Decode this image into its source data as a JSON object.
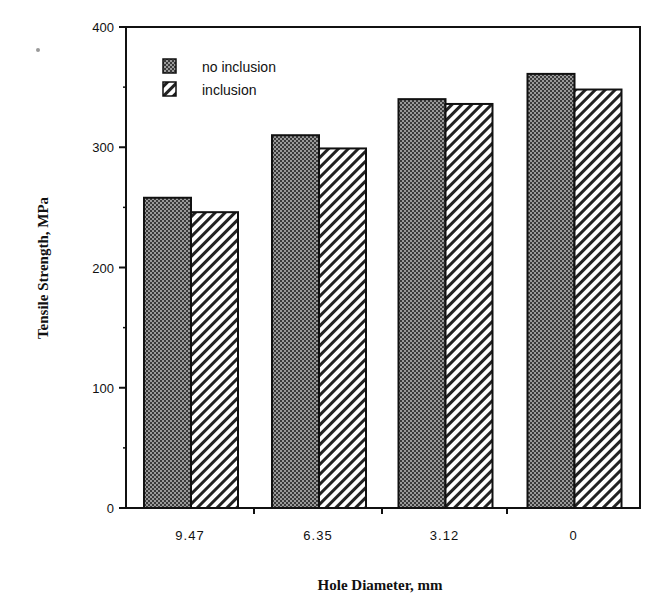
{
  "chart_data": {
    "type": "bar",
    "title": "",
    "xlabel": "Hole Diameter, mm",
    "ylabel": "Tensile Strength,  MPa",
    "categories": [
      "9.47",
      "6.35",
      "3.12",
      "0"
    ],
    "series": [
      {
        "name": "no inclusion",
        "pattern": "checker",
        "values": [
          258,
          310,
          340,
          361
        ]
      },
      {
        "name": "inclusion",
        "pattern": "hatch",
        "values": [
          246,
          299,
          336,
          348
        ]
      }
    ],
    "ylim": [
      0,
      400
    ],
    "yticks": [
      0,
      100,
      200,
      300,
      400
    ],
    "grid": false,
    "legend_position": "upper-left-inside",
    "colors": {
      "axis": "#111111",
      "checker_dark": "#3a3a3a",
      "checker_light": "#9a9a9a",
      "hatch_line": "#222222",
      "background": "#ffffff"
    }
  }
}
